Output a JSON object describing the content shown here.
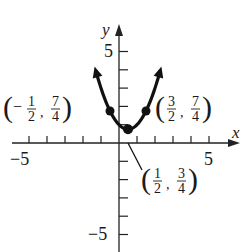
{
  "chart_data": {
    "type": "line",
    "title": "",
    "xlabel": "x",
    "ylabel": "y",
    "xlim": [
      -5.5,
      6
    ],
    "ylim": [
      -6,
      6
    ],
    "grid": false,
    "x_tick_labels": [
      "-5",
      "5"
    ],
    "y_tick_labels": [
      "5",
      "-5"
    ],
    "x_ticks": [
      -5,
      -4,
      -3,
      -2,
      -1,
      1,
      2,
      3,
      4,
      5
    ],
    "y_ticks": [
      -5,
      -4,
      -3,
      -2,
      -1,
      1,
      2,
      3,
      4,
      5
    ],
    "function": "f(x) = x^2 - x + 1",
    "domain": [
      -1.25,
      2.25
    ],
    "series": [
      {
        "name": "f(x)",
        "x": [
          -1.25,
          -1,
          -0.5,
          0,
          0.5,
          1,
          1.5,
          2,
          2.25
        ],
        "values": [
          3.8125,
          3,
          1.75,
          1,
          0.75,
          1,
          1.75,
          3,
          3.8125
        ]
      }
    ],
    "points": [
      {
        "x": -0.5,
        "y": 1.75,
        "label": "(-1/2, 7/4)"
      },
      {
        "x": 0.5,
        "y": 0.75,
        "label": "(1/2, 3/4)"
      },
      {
        "x": 1.5,
        "y": 1.75,
        "label": "(3/2, 7/4)"
      }
    ],
    "annotations": [
      {
        "text": "(−1/2, 7/4)",
        "num_x": "1",
        "den_x": "2",
        "sign_x": "−",
        "num_y": "7",
        "den_y": "4"
      },
      {
        "text": "(3/2, 7/4)",
        "num_x": "3",
        "den_x": "2",
        "sign_x": "",
        "num_y": "7",
        "den_y": "4"
      },
      {
        "text": "(1/2, 3/4)",
        "num_x": "1",
        "den_x": "2",
        "sign_x": "",
        "num_y": "3",
        "den_y": "4"
      }
    ]
  },
  "labels": {
    "x_axis": "x",
    "y_axis": "y",
    "x_min_tick": "−5",
    "x_max_tick": "5",
    "y_max_tick": "5",
    "y_min_tick": "−5"
  },
  "colors": {
    "curve": "#111111",
    "axes": "#222222",
    "text": "#1a1a1a",
    "background": "#ffffff"
  }
}
